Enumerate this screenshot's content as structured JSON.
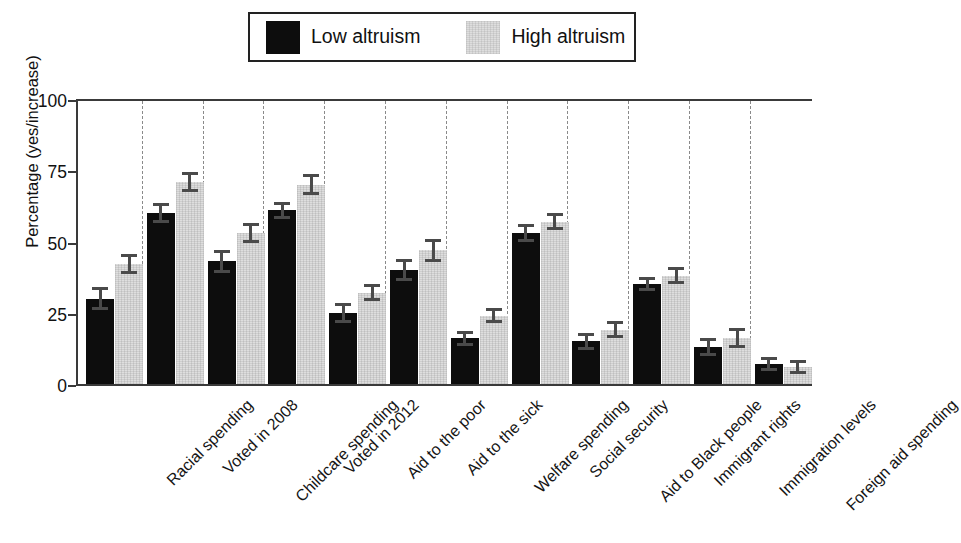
{
  "chart_data": {
    "type": "bar",
    "title": "",
    "xlabel": "",
    "ylabel": "Percentage (yes/increase)",
    "ylim": [
      0,
      100
    ],
    "yticks": [
      0,
      25,
      50,
      75,
      100
    ],
    "grid": "vertical dashed separators between category groups",
    "legend_position": "top-center, boxed",
    "categories": [
      "Racial spending",
      "Voted in 2008",
      "Childcare spending",
      "Voted in 2012",
      "Aid to the poor",
      "Aid to the sick",
      "Welfare spending",
      "Social security",
      "Aid to Black people",
      "Immigrant rights",
      "Immigration levels",
      "Foreign aid spending"
    ],
    "series": [
      {
        "name": "Low altruism",
        "color": "#0d0d0d",
        "values": [
          30,
          60,
          43,
          61,
          25,
          40,
          16,
          53,
          15,
          35,
          13,
          7
        ],
        "errors": [
          3.5,
          3,
          3.5,
          2.5,
          3,
          3.5,
          2,
          2.5,
          2.5,
          2,
          2.5,
          2
        ]
      },
      {
        "name": "High altruism",
        "color": "#dedede",
        "values": [
          42,
          71,
          53,
          70,
          32,
          47,
          24,
          57,
          19,
          38,
          16,
          6
        ],
        "errors": [
          3,
          3,
          3,
          3,
          2.5,
          3.5,
          2,
          2.5,
          2.5,
          2.5,
          3,
          2
        ]
      }
    ]
  },
  "legend": {
    "low_label": "Low altruism",
    "high_label": "High altruism"
  }
}
